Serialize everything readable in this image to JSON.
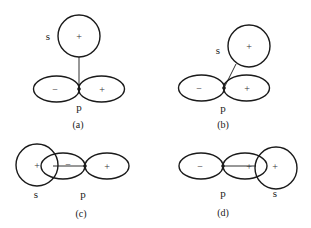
{
  "figure": {
    "panels": [
      {
        "id": "a",
        "caption": "(a)",
        "s_label": "s",
        "p_label": "p",
        "s_sign": "+",
        "p_lobe_left_sign": "−",
        "p_lobe_right_sign": "+",
        "s_position": "above nodal point"
      },
      {
        "id": "b",
        "caption": "(b)",
        "s_label": "s",
        "p_label": "p",
        "s_sign": "+",
        "p_lobe_left_sign": "−",
        "p_lobe_right_sign": "+",
        "s_position": "upper right, angled"
      },
      {
        "id": "c",
        "caption": "(c)",
        "s_label": "s",
        "p_label": "p",
        "s_sign": "+",
        "p_lobe_left_sign": "−",
        "p_lobe_right_sign": "+",
        "s_position": "overlapping negative lobe"
      },
      {
        "id": "d",
        "caption": "(d)",
        "s_label": "s",
        "p_label": "p",
        "s_sign": "+",
        "p_lobe_left_sign": "−",
        "p_lobe_right_sign": "+",
        "s_position": "overlapping positive lobe"
      }
    ]
  }
}
